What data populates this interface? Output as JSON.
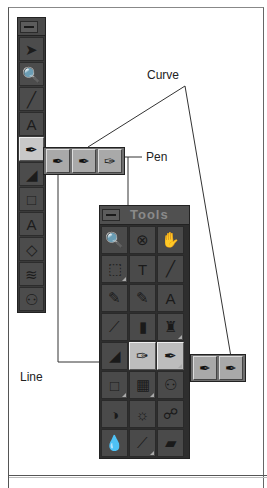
{
  "callouts": {
    "curve": "Curve",
    "pen": "Pen",
    "line": "Line"
  },
  "vertical_palette": {
    "minimize_icon": "minimize-icon",
    "tools": [
      {
        "name": "selection-arrow-icon",
        "glyph": "➤",
        "selected": false
      },
      {
        "name": "zoom-magnifier-icon",
        "glyph": "🔍",
        "selected": false
      },
      {
        "name": "eyedropper-icon",
        "glyph": "╱",
        "selected": false
      },
      {
        "name": "text-tool-icon",
        "glyph": "A",
        "selected": false
      },
      {
        "name": "pen-tool-icon",
        "glyph": "✒",
        "selected": true
      },
      {
        "name": "brush-icon",
        "glyph": "◢",
        "selected": false
      },
      {
        "name": "rectangle-icon",
        "glyph": "□",
        "selected": false
      },
      {
        "name": "type-A-icon",
        "glyph": "A",
        "selected": false
      },
      {
        "name": "paint-bucket-icon",
        "glyph": "◇",
        "selected": false
      },
      {
        "name": "gradient-brush-icon",
        "glyph": "≋",
        "selected": false
      },
      {
        "name": "people-icon",
        "glyph": "⚇",
        "selected": false
      }
    ]
  },
  "top_flyout": {
    "tools": [
      {
        "name": "line-tool-icon",
        "glyph": "✒"
      },
      {
        "name": "curve-tool-icon",
        "glyph": "✒"
      },
      {
        "name": "pen-nib-icon",
        "glyph": "✑"
      }
    ]
  },
  "tools_palette": {
    "title": "Tools",
    "tools": [
      {
        "name": "zoom-magnifier-icon",
        "glyph": "🔍",
        "selected": false,
        "corner": false
      },
      {
        "name": "hatched-circle-icon",
        "glyph": "⊗",
        "selected": false,
        "corner": false
      },
      {
        "name": "hand-icon",
        "glyph": "✋",
        "selected": false,
        "corner": false
      },
      {
        "name": "marquee-select-icon",
        "glyph": "⬚",
        "selected": false,
        "corner": true
      },
      {
        "name": "text-T-icon",
        "glyph": "T",
        "selected": false,
        "corner": false
      },
      {
        "name": "eyedropper-icon",
        "glyph": "╱",
        "selected": false,
        "corner": false
      },
      {
        "name": "brush-icon",
        "glyph": "✎",
        "selected": false,
        "corner": false
      },
      {
        "name": "marker-icon",
        "glyph": "✎",
        "selected": false,
        "corner": false
      },
      {
        "name": "text-tool-icon",
        "glyph": "A",
        "selected": false,
        "corner": false
      },
      {
        "name": "airbrush-icon",
        "glyph": "⟋",
        "selected": false,
        "corner": false
      },
      {
        "name": "spray-can-icon",
        "glyph": "▮",
        "selected": false,
        "corner": false
      },
      {
        "name": "stamp-icon",
        "glyph": "♜",
        "selected": false,
        "corner": true
      },
      {
        "name": "calligraphy-icon",
        "glyph": "◢",
        "selected": false,
        "corner": false
      },
      {
        "name": "pen-nib-icon",
        "glyph": "✑",
        "selected": true,
        "corner": false
      },
      {
        "name": "curve-pen-icon",
        "glyph": "✒",
        "selected": true,
        "corner": true
      },
      {
        "name": "rectangle-icon",
        "glyph": "□",
        "selected": false,
        "corner": true
      },
      {
        "name": "filled-rectangle-icon",
        "glyph": "▦",
        "selected": false,
        "corner": true
      },
      {
        "name": "people-icon",
        "glyph": "⚇",
        "selected": false,
        "corner": false
      },
      {
        "name": "contrast-circle-icon",
        "glyph": "◑",
        "selected": false,
        "corner": false
      },
      {
        "name": "sun-icon",
        "glyph": "☼",
        "selected": false,
        "corner": false
      },
      {
        "name": "binoculars-icon",
        "glyph": "☍",
        "selected": false,
        "corner": false
      },
      {
        "name": "droplet-icon",
        "glyph": "💧",
        "selected": false,
        "corner": false
      },
      {
        "name": "smudge-brush-icon",
        "glyph": "⟋",
        "selected": false,
        "corner": true
      },
      {
        "name": "eraser-icon",
        "glyph": "▰",
        "selected": false,
        "corner": false
      }
    ]
  },
  "bottom_flyout": {
    "tools": [
      {
        "name": "line-tool-icon",
        "glyph": "✒"
      },
      {
        "name": "curve-tool-icon",
        "glyph": "✒"
      }
    ]
  }
}
